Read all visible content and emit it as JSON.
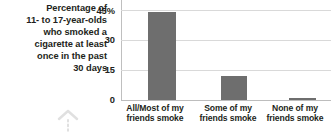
{
  "caption": {
    "lines": [
      "Percentage of",
      "11- to 17-year-olds",
      "who smoked a",
      "cigarette at least",
      "once in the past",
      "30 days"
    ]
  },
  "marks": {
    "chevron_up_icon": "chevron-up-icon",
    "dotted_stem": "dotted-vertical-line"
  },
  "colors": {
    "bar": "#6e6e6e",
    "gridline": "#d9d9d9",
    "axis": "#bfbfbf",
    "text": "#231f20"
  },
  "chart_data": {
    "type": "bar",
    "title": "Percentage of 11- to 17-year-olds who smoked a cigarette at least once in the past 30 days",
    "xlabel": "",
    "ylabel": "",
    "categories": [
      "All/Most of my friends smoke",
      "Some of my friends smoke",
      "None of my friends smoke"
    ],
    "category_lines": [
      [
        "All/Most of my",
        "friends smoke"
      ],
      [
        "Some of my",
        "friends smoke"
      ],
      [
        "None of my",
        "friends smoke"
      ]
    ],
    "values": [
      44,
      12,
      1
    ],
    "ylim": [
      0,
      45
    ],
    "yticks": [
      0,
      15,
      30,
      45
    ],
    "ytick_labels": [
      "0",
      "15",
      "30",
      "45%"
    ],
    "grid": true,
    "legend": "none"
  }
}
